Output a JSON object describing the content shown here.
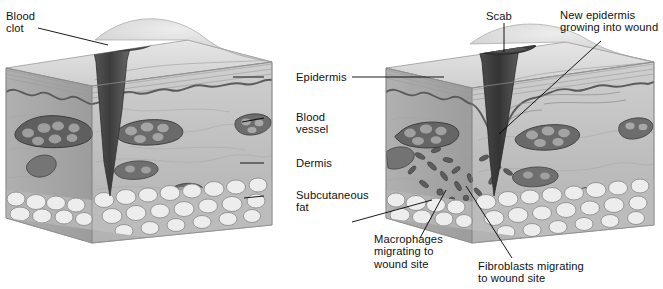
{
  "figure": {
    "type": "anatomical-cross-section-diagram",
    "panels": 2,
    "palette": {
      "background": "#ffffff",
      "epidermis_surface": "#d9d9d9",
      "epidermis_line": "#5d5d5d",
      "dermis_fill": "#b9b9b9",
      "dermis_side": "#a8a8a8",
      "fat_fill": "#ececec",
      "fat_outline": "#8d8d8d",
      "vessel_fill": "#5a5a5a",
      "vessel_cells": "#9a9a9a",
      "clot_fill": "#4a4a4a",
      "scab_fill": "#3f3f3f",
      "leader_line": "#000000",
      "text": "#111111"
    }
  },
  "labels": {
    "blood_clot": "Blood\nclot",
    "epidermis": "Epidermis",
    "blood_vessel": "Blood\nvessel",
    "dermis": "Dermis",
    "subcutaneous_fat": "Subcutaneous\nfat",
    "scab": "Scab",
    "new_epidermis": "New epidermis\ngrowing into wound",
    "macrophages": "Macrophages\nmigrating to\nwound site",
    "fibroblasts": "Fibroblasts migrating\nto wound site"
  },
  "left_panel": {
    "stage": "Fresh wound with blood clot",
    "features": [
      "blood clot filling wound",
      "epidermis",
      "blood vessel",
      "dermis",
      "subcutaneous fat"
    ]
  },
  "right_panel": {
    "stage": "Healing wound with scab",
    "features": [
      "scab",
      "new epidermis growing into wound",
      "macrophages migrating to wound site",
      "fibroblasts migrating to wound site",
      "subcutaneous fat"
    ]
  },
  "caption": ""
}
